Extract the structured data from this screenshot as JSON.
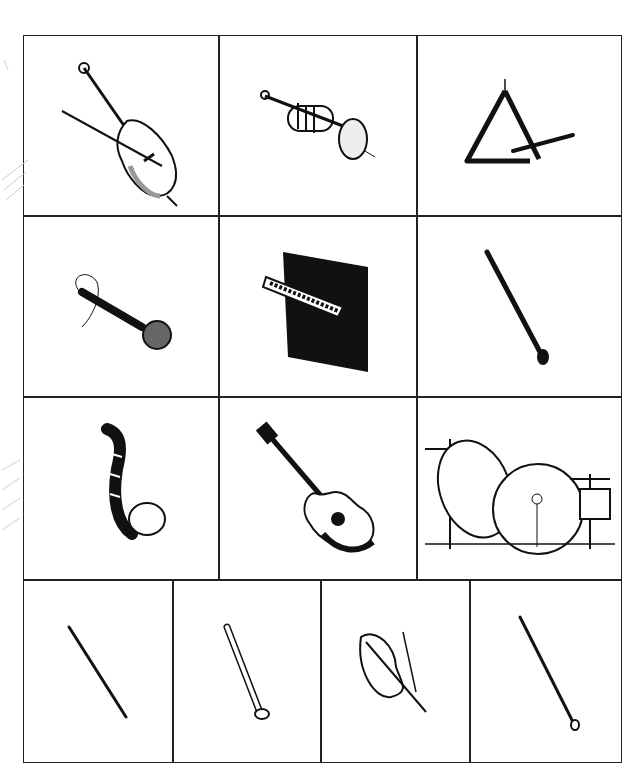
{
  "worksheet": {
    "rows": [
      {
        "cells": [
          {
            "instrument": "cello",
            "icon": "cello-icon"
          },
          {
            "instrument": "trumpet",
            "icon": "trumpet-icon"
          },
          {
            "instrument": "triangle",
            "icon": "triangle-icon"
          }
        ]
      },
      {
        "cells": [
          {
            "instrument": "microphone",
            "icon": "microphone-icon"
          },
          {
            "instrument": "piano",
            "icon": "piano-icon"
          },
          {
            "instrument": "clarinet",
            "icon": "clarinet-icon"
          }
        ]
      },
      {
        "cells": [
          {
            "instrument": "saxophone",
            "icon": "saxophone-icon"
          },
          {
            "instrument": "guitar",
            "icon": "guitar-icon"
          },
          {
            "instrument": "drum kit",
            "icon": "drum-kit-icon"
          }
        ]
      },
      {
        "cells": [
          {
            "instrument": "flute",
            "icon": "flute-icon"
          },
          {
            "instrument": "recorder",
            "icon": "recorder-icon"
          },
          {
            "instrument": "violin",
            "icon": "violin-icon"
          },
          {
            "instrument": "oboe",
            "icon": "oboe-icon"
          }
        ]
      }
    ],
    "margin_notes": [
      "pencil scribble",
      "pencil scribble"
    ],
    "colors": {
      "ink": "#222222",
      "paper": "#ffffff",
      "pencil": "#bbbbbb"
    }
  }
}
